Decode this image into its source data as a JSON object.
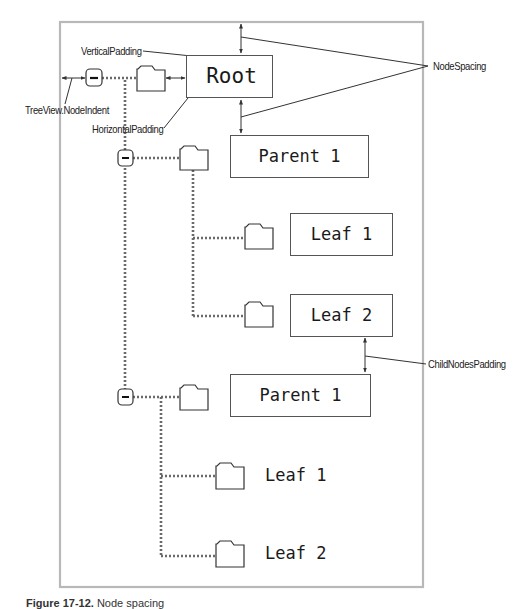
{
  "diagram": {
    "type": "annotated tree view layout",
    "annotations": {
      "vertical_padding": "VerticalPadding",
      "node_indent": "TreeView.NodeIndent",
      "horizontal_padding": "HorizontalPadding",
      "node_spacing": "NodeSpacing",
      "child_nodes_padding": "ChildNodesPadding"
    },
    "nodes": [
      {
        "id": "root",
        "label": "Root",
        "level": 0,
        "expander": "−",
        "boxed": true
      },
      {
        "id": "parent-a",
        "label": "Parent 1",
        "level": 1,
        "expander": "−",
        "boxed": true
      },
      {
        "id": "leaf-a1",
        "label": "Leaf 1",
        "level": 2,
        "boxed": true
      },
      {
        "id": "leaf-a2",
        "label": "Leaf 2",
        "level": 2,
        "boxed": true
      },
      {
        "id": "parent-b",
        "label": "Parent 1",
        "level": 1,
        "expander": "−",
        "boxed": true
      },
      {
        "id": "leaf-b1",
        "label": "Leaf 1",
        "level": 2,
        "boxed": false
      },
      {
        "id": "leaf-b2",
        "label": "Leaf 2",
        "level": 2,
        "boxed": false
      }
    ],
    "colors": {
      "frame": "#b8b8b8",
      "line": "#333333",
      "dotted": "#6a6a6a"
    }
  },
  "caption": {
    "figure": "Figure 17-12.",
    "text": "Node spacing"
  }
}
